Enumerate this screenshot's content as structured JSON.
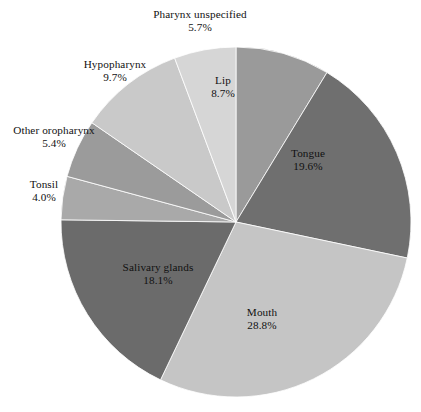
{
  "chart_data": {
    "type": "pie",
    "title": "",
    "subtitle": "",
    "xlabel": "",
    "ylabel": "",
    "legend_position": "none",
    "grid": false,
    "start_angle_deg": 0,
    "direction": "clockwise",
    "categories": [
      "Lip",
      "Tongue",
      "Mouth",
      "Salivary glands",
      "Tonsil",
      "Other oropharynx",
      "Hypopharynx",
      "Pharynx unspecified"
    ],
    "values": [
      8.7,
      19.6,
      28.8,
      18.1,
      4.0,
      5.4,
      9.7,
      5.7
    ],
    "value_labels": [
      "8.7%",
      "19.6%",
      "28.8%",
      "18.1%",
      "4.0%",
      "5.4%",
      "9.7%",
      "5.7%"
    ],
    "unit": "%",
    "slices": [
      {
        "name": "Lip",
        "label_line1": "Lip",
        "label_line2": "8.7%",
        "value": 8.7,
        "color": "#9a9a9a",
        "label_placement": "inside"
      },
      {
        "name": "Tongue",
        "label_line1": "Tongue",
        "label_line2": "19.6%",
        "value": 19.6,
        "color": "#6f6f6f",
        "label_placement": "inside"
      },
      {
        "name": "Mouth",
        "label_line1": "Mouth",
        "label_line2": "28.8%",
        "value": 28.8,
        "color": "#c5c5c5",
        "label_placement": "inside"
      },
      {
        "name": "Salivary glands",
        "label_line1": "Salivary glands",
        "label_line2": "18.1%",
        "value": 18.1,
        "color": "#6b6b6b",
        "label_placement": "inside"
      },
      {
        "name": "Tonsil",
        "label_line1": "Tonsil",
        "label_line2": "4.0%",
        "value": 4.0,
        "color": "#a9a9a9",
        "label_placement": "outside"
      },
      {
        "name": "Other oropharynx",
        "label_line1": "Other oropharynx",
        "label_line2": "5.4%",
        "value": 5.4,
        "color": "#9b9b9b",
        "label_placement": "outside"
      },
      {
        "name": "Hypopharynx",
        "label_line1": "Hypopharynx",
        "label_line2": "9.7%",
        "value": 9.7,
        "color": "#c9c9c9",
        "label_placement": "outside"
      },
      {
        "name": "Pharynx unspecified",
        "label_line1": "Pharynx unspecified",
        "label_line2": "5.7%",
        "value": 5.7,
        "color": "#d6d6d6",
        "label_placement": "outside"
      }
    ],
    "background_color": "#ffffff",
    "text_color": "#111111"
  }
}
